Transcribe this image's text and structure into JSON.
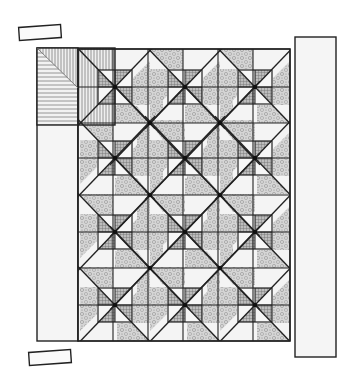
{
  "colors": {
    "outline": "#222222",
    "background_fabric": "#f4f4f4",
    "floral_fabric": "#cfcfcf",
    "checked_fabric": "#a9a9a9",
    "stripe_fabric": "#8a8a8a",
    "border_fabric": "#f5f5f5"
  },
  "loose_pieces": [
    {
      "name": "top-loose-strip",
      "x": 19,
      "y": 26,
      "w": 42,
      "h": 13,
      "rotate": -4
    },
    {
      "name": "bottom-loose-strip",
      "x": 29,
      "y": 351,
      "w": 42,
      "h": 13,
      "rotate": -4
    }
  ],
  "left_border": {
    "x": 37,
    "y": 48,
    "w": 41,
    "h": 293
  },
  "right_border": {
    "x": 295,
    "y": 37,
    "w": 41,
    "h": 320
  },
  "corner_block": {
    "x": 37,
    "y": 48,
    "w": 78,
    "h": 77,
    "fabric": "stripe"
  },
  "main_block": {
    "x": 78,
    "y": 49,
    "w": 212,
    "h": 292,
    "columns": 6,
    "rows": 8,
    "col_lines": [
      78,
      113,
      148,
      183,
      218,
      253,
      290
    ],
    "row_lines": [
      49,
      87,
      123,
      158,
      195,
      232,
      268,
      305,
      341
    ]
  },
  "pinwheel_stars": [
    [
      115,
      87
    ],
    [
      185,
      87
    ],
    [
      255,
      87
    ],
    [
      115,
      158
    ],
    [
      185,
      158
    ],
    [
      255,
      158
    ],
    [
      115,
      232
    ],
    [
      185,
      232
    ],
    [
      255,
      232
    ],
    [
      115,
      305
    ],
    [
      185,
      305
    ],
    [
      255,
      305
    ]
  ],
  "floral_stars": [
    [
      150,
      123
    ],
    [
      220,
      123
    ],
    [
      150,
      195
    ],
    [
      220,
      195
    ],
    [
      150,
      268
    ],
    [
      220,
      268
    ]
  ],
  "edge_vertices": [
    [
      78,
      49
    ],
    [
      150,
      49
    ],
    [
      220,
      49
    ],
    [
      290,
      49
    ],
    [
      78,
      123
    ],
    [
      290,
      123
    ],
    [
      78,
      195
    ],
    [
      290,
      195
    ],
    [
      78,
      268
    ],
    [
      290,
      268
    ],
    [
      78,
      341
    ],
    [
      150,
      341
    ],
    [
      220,
      341
    ],
    [
      290,
      341
    ]
  ]
}
